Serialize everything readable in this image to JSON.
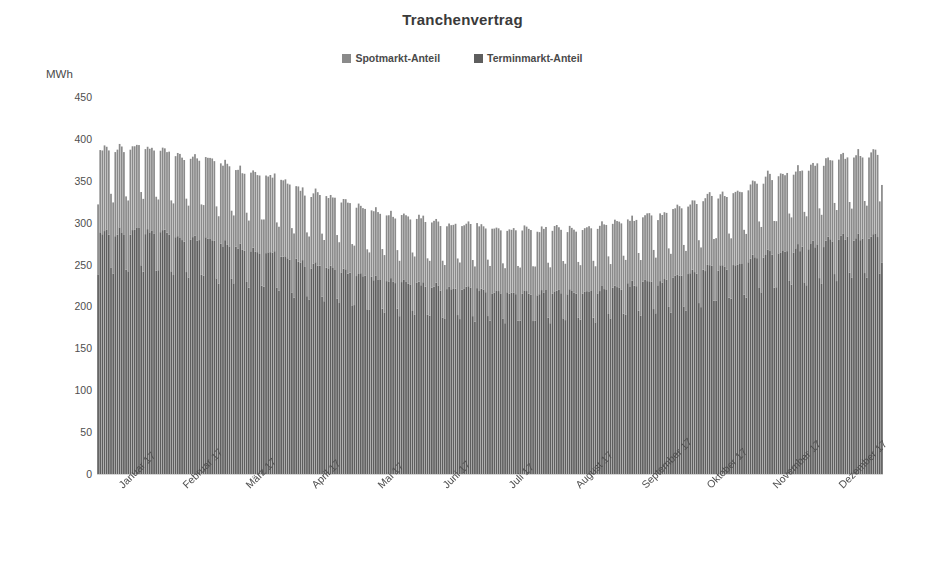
{
  "chart_data": {
    "type": "bar",
    "subtype": "stacked-column",
    "title": "Tranchenvertrag",
    "xlabel": "",
    "ylabel": "MWh",
    "ylim": [
      0,
      450
    ],
    "yticks": [
      0,
      50,
      100,
      150,
      200,
      250,
      300,
      350,
      400,
      450
    ],
    "ytick_labels": [
      "0",
      "50",
      "100",
      "150",
      "200",
      "250",
      "300",
      "350",
      "400",
      "450"
    ],
    "grid": false,
    "legend_position": "top-center",
    "categories": [
      "Januar 17",
      "Februar 17",
      "März 17",
      "April 17",
      "Mai 17",
      "Juni 17",
      "Juli 17",
      "August 17",
      "September 17",
      "Oktober 17",
      "November 17",
      "Dezember 17"
    ],
    "category_axis_note": "Daily columns for the year 2017; axis labelled once per month",
    "series": [
      {
        "name": "Terminmarkt-Anteil",
        "color": "#5e5e5e",
        "stack_order": 0,
        "monthly_mean": [
          283,
          272,
          258,
          238,
          222,
          214,
          210,
          212,
          221,
          238,
          258,
          272
        ],
        "monthly_weekday_peak": [
          290,
          280,
          266,
          246,
          229,
          221,
          216,
          218,
          228,
          246,
          266,
          280
        ],
        "monthly_weekend_low": [
          247,
          238,
          226,
          208,
          194,
          187,
          184,
          186,
          194,
          208,
          226,
          238
        ]
      },
      {
        "name": "Spotmarkt-Anteil",
        "color": "#8a8a8a",
        "stack_order": 1,
        "monthly_mean": [
          101,
          97,
          92,
          85,
          79,
          76,
          75,
          76,
          79,
          85,
          92,
          97
        ],
        "monthly_weekday_peak": [
          100,
          97,
          92,
          85,
          79,
          76,
          75,
          76,
          79,
          85,
          92,
          97
        ],
        "monthly_weekend_low": [
          88,
          85,
          81,
          74,
          69,
          67,
          66,
          67,
          69,
          74,
          81,
          85
        ]
      }
    ],
    "total_monthly_weekday_peak": [
      390,
      377,
      358,
      331,
      308,
      297,
      291,
      294,
      307,
      331,
      358,
      377
    ],
    "total_monthly_weekend_low": [
      335,
      323,
      307,
      282,
      263,
      254,
      250,
      253,
      263,
      282,
      307,
      323
    ],
    "annotations": [
      "Seasonal U-shape: highest in winter (Januar / Dezember), lowest mid-summer (Juli)",
      "Weekly rhythm: five tall weekday columns followed by two lower weekend columns",
      "Final December column truncated at approximately 345 MWh"
    ]
  },
  "chart": {
    "title": "Tranchenvertrag",
    "y_axis_title": "MWh",
    "background_color": "#ffffff",
    "plot_left_px": 97,
    "plot_top_px": 97,
    "plot_width_px": 786,
    "plot_height_px": 377
  },
  "legend": {
    "items": [
      {
        "label": "Spotmarkt-Anteil",
        "color": "#8a8a8a"
      },
      {
        "label": "Terminmarkt-Anteil",
        "color": "#5e5e5e"
      }
    ]
  }
}
